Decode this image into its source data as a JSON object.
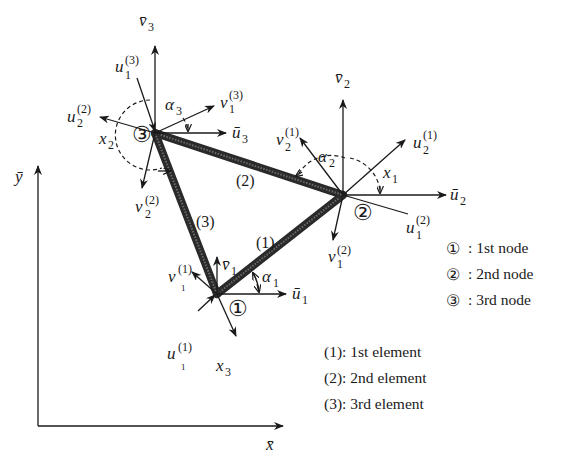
{
  "diagram": {
    "global_axes": {
      "x_label": "x̄",
      "y_label": "ȳ"
    },
    "nodes": [
      {
        "id": "1",
        "marker": "①",
        "labels": {
          "u_bar": "ū",
          "v_bar": "v̄",
          "sub": "1",
          "alpha": "α",
          "alpha_sub": "1",
          "v_local": "v",
          "v_local_sup": "(1)",
          "v_local_sub": "1",
          "u_local": "u",
          "u_local_sup": "(1)",
          "u_local_sub": "1",
          "x_axis": "x",
          "x_axis_sub": "3"
        }
      },
      {
        "id": "2",
        "marker": "②",
        "labels": {
          "u_bar": "ū",
          "v_bar": "v̄",
          "sub": "2",
          "alpha": "α",
          "alpha_sub": "2",
          "u_a": "u",
          "u_a_sup": "(1)",
          "u_a_sub": "2",
          "v_a": "v",
          "v_a_sup": "(1)",
          "v_a_sub": "2",
          "u_b": "u",
          "u_b_sup": "(2)",
          "u_b_sub": "1",
          "v_b": "v",
          "v_b_sup": "(2)",
          "v_b_sub": "1",
          "x_axis": "x",
          "x_axis_sub": "1"
        }
      },
      {
        "id": "3",
        "marker": "③",
        "labels": {
          "u_bar": "ū",
          "v_bar": "v̄",
          "sub": "3",
          "alpha": "α",
          "alpha_sub": "3",
          "u_a": "u",
          "u_a_sup": "(3)",
          "u_a_sub": "1",
          "v_a": "v",
          "v_a_sup": "(3)",
          "v_a_sub": "1",
          "u_b": "u",
          "u_b_sup": "(2)",
          "u_b_sub": "2",
          "v_b": "v",
          "v_b_sup": "(2)",
          "v_b_sub": "2",
          "x_axis": "x",
          "x_axis_sub": "2"
        }
      }
    ],
    "elements": [
      {
        "label": "(1)"
      },
      {
        "label": "(2)"
      },
      {
        "label": "(3)"
      }
    ],
    "legend": {
      "nodes": [
        {
          "marker": "①",
          "text": ": 1st node"
        },
        {
          "marker": "②",
          "text": ": 2nd node"
        },
        {
          "marker": "③",
          "text": ": 3rd node"
        }
      ],
      "elements": [
        {
          "text": "(1): 1st element"
        },
        {
          "text": "(2): 2nd element"
        },
        {
          "text": "(3): 3rd element"
        }
      ]
    }
  }
}
